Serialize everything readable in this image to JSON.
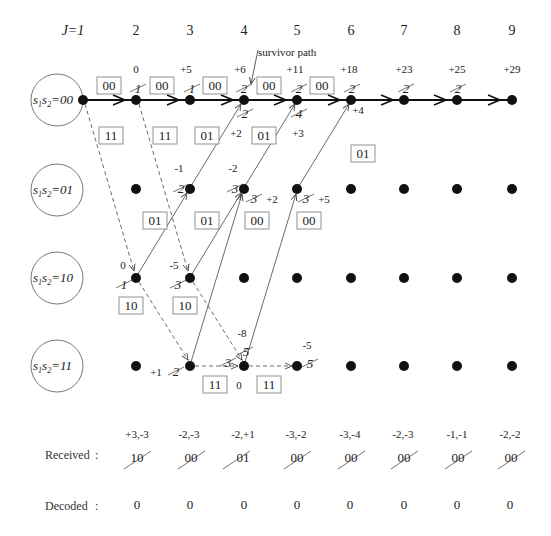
{
  "diagram": {
    "title_column_prefix": "J=1",
    "column_labels": [
      "J=1",
      "2",
      "3",
      "4",
      "5",
      "6",
      "7",
      "8",
      "9"
    ],
    "annotation": "survivor path",
    "state_labels": [
      {
        "main": "s",
        "sub1": "1",
        "mid": "s",
        "sub2": "2",
        "value": "=00"
      },
      {
        "main": "s",
        "sub1": "1",
        "mid": "s",
        "sub2": "2",
        "value": "=01"
      },
      {
        "main": "s",
        "sub1": "1",
        "mid": "s",
        "sub2": "2",
        "value": "=10"
      },
      {
        "main": "s",
        "sub1": "1",
        "mid": "s",
        "sub2": "2",
        "value": "=11"
      }
    ],
    "states": [
      "00",
      "01",
      "10",
      "11"
    ],
    "metrics_row00": [
      "0",
      "+5",
      "+6",
      "+11",
      "+18",
      "+23",
      "+25",
      "+29"
    ],
    "struck_row00": [
      "1",
      "1",
      "2",
      "2",
      "2",
      "2",
      "2"
    ],
    "branch_labels_row00_top": [
      "00",
      "00",
      "00",
      "00",
      "00"
    ],
    "branch_labels_row00_bottom": [
      "11",
      "11",
      "01",
      "01",
      "01"
    ],
    "lower_metrics_row00": {
      "col4_struck": "2",
      "col4_metric": "+2",
      "col5_struck": "4",
      "col5_metric": "+3",
      "col6_metric": "+4"
    },
    "metrics_row01": {
      "col3": "-1",
      "col3_struck": "2",
      "col4": "-2",
      "col4_struck_a": "3",
      "col4_struck_b": "3",
      "col4_alt": "+2",
      "col5_struck": "3",
      "col5_alt": "+5"
    },
    "branch_labels_row01": [
      "01",
      "01",
      "00",
      "00"
    ],
    "metrics_row10": {
      "col2": "0",
      "col2_struck": "1",
      "col3": "-5",
      "col3_struck": "3"
    },
    "branch_labels_row10": [
      "10",
      "10"
    ],
    "metrics_row11": {
      "col3_alt": "+1",
      "col3_struck": "2",
      "col4_struck_a": "3",
      "col4_top": "-8",
      "col4_struck_b": "5",
      "col4_bottom": "0",
      "col5": "-5",
      "col5_struck": "5"
    },
    "branch_labels_row11": [
      "11",
      "11"
    ]
  },
  "footer": {
    "received_label": "Received",
    "decoded_label": "Decoded",
    "separator": ":",
    "received_soft": [
      "+3,-3",
      "-2,-3",
      "-2,+1",
      "-3,-2",
      "-3,-4",
      "-2,-3",
      "-1,-1",
      "-2,-2"
    ],
    "received_hard": [
      "10",
      "00",
      "01",
      "00",
      "00",
      "00",
      "00",
      "00"
    ],
    "decoded": [
      "0",
      "0",
      "0",
      "0",
      "0",
      "0",
      "0",
      "0"
    ]
  },
  "colors": {
    "line": "#222222",
    "node": "#111111",
    "box_border": "#777777"
  }
}
